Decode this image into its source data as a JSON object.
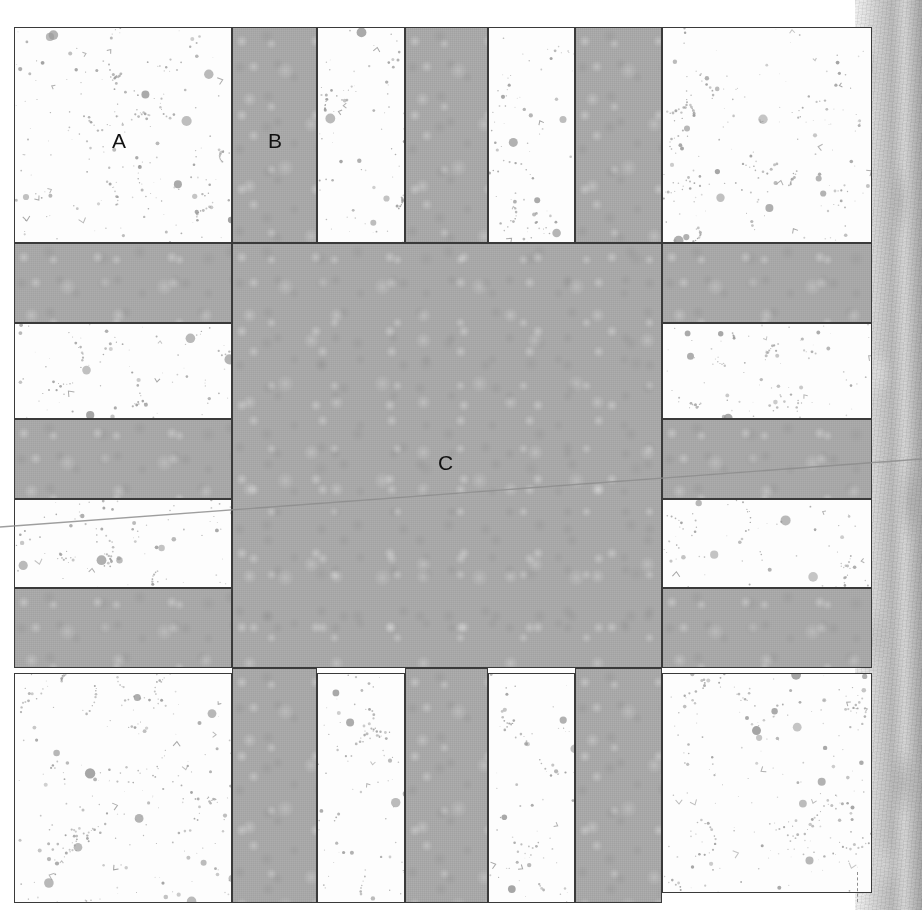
{
  "figure": {
    "kind": "geological-thin-section-schematic",
    "background_color": "#ffffff",
    "canvas": {
      "width": 922,
      "height": 910
    }
  },
  "palette": {
    "matrix_gray": "#aaaaaa",
    "clast_white": "#fdfdfd",
    "outline": "#3a3a3a",
    "speckle": "#9a9a9a",
    "label_text": "#111111",
    "crack_line": "#8d8d8d",
    "edge_light": "#f2f2f2",
    "edge_dark": "#a9a9a9"
  },
  "labels": [
    {
      "id": "label-a",
      "text": "A",
      "x": 112,
      "y": 130,
      "describes": "white speckled clast block (upper-left)"
    },
    {
      "id": "label-b",
      "text": "B",
      "x": 268,
      "y": 130,
      "describes": "gray matrix band (upper, second column)"
    },
    {
      "id": "label-c",
      "text": "C",
      "x": 438,
      "y": 452,
      "describes": "large central gray matrix region"
    }
  ],
  "grid": {
    "outer": {
      "x": 14,
      "y": 27,
      "width": 858,
      "height": 876
    },
    "column_edges": [
      14,
      232,
      317,
      405,
      488,
      575,
      662,
      872
    ],
    "row_edges": [
      27,
      243,
      323,
      419,
      499,
      588,
      668,
      903
    ],
    "description": "Seven vertical column bands and seven horizontal row bands forming an alternating white-clast / gray-matrix checker pattern around a large central gray region."
  },
  "cells": [
    {
      "name": "cell-r1c1",
      "fill": "white",
      "x": 14,
      "y": 27,
      "w": 218,
      "h": 216
    },
    {
      "name": "cell-r1c2",
      "fill": "gray",
      "x": 232,
      "y": 27,
      "w": 85,
      "h": 216
    },
    {
      "name": "cell-r1c3",
      "fill": "white",
      "x": 317,
      "y": 27,
      "w": 88,
      "h": 216
    },
    {
      "name": "cell-r1c4",
      "fill": "gray",
      "x": 405,
      "y": 27,
      "w": 83,
      "h": 216
    },
    {
      "name": "cell-r1c5",
      "fill": "white",
      "x": 488,
      "y": 27,
      "w": 87,
      "h": 216
    },
    {
      "name": "cell-r1c6",
      "fill": "gray",
      "x": 575,
      "y": 27,
      "w": 87,
      "h": 216
    },
    {
      "name": "cell-r1c7",
      "fill": "white",
      "x": 662,
      "y": 27,
      "w": 210,
      "h": 216
    },
    {
      "name": "cell-r2c1",
      "fill": "gray",
      "x": 14,
      "y": 243,
      "w": 218,
      "h": 80
    },
    {
      "name": "cell-r2c7",
      "fill": "gray",
      "x": 662,
      "y": 243,
      "w": 210,
      "h": 80
    },
    {
      "name": "cell-r3c1",
      "fill": "white",
      "x": 14,
      "y": 323,
      "w": 218,
      "h": 96
    },
    {
      "name": "cell-r3c7",
      "fill": "white",
      "x": 662,
      "y": 323,
      "w": 210,
      "h": 96
    },
    {
      "name": "cell-r4c1",
      "fill": "gray",
      "x": 14,
      "y": 419,
      "w": 218,
      "h": 80
    },
    {
      "name": "cell-r4c7",
      "fill": "gray",
      "x": 662,
      "y": 419,
      "w": 210,
      "h": 80
    },
    {
      "name": "cell-r5c1",
      "fill": "white",
      "x": 14,
      "y": 499,
      "w": 218,
      "h": 89
    },
    {
      "name": "cell-r5c7",
      "fill": "white",
      "x": 662,
      "y": 499,
      "w": 210,
      "h": 89
    },
    {
      "name": "cell-r6c1",
      "fill": "gray",
      "x": 14,
      "y": 588,
      "w": 218,
      "h": 80
    },
    {
      "name": "cell-r6c7",
      "fill": "gray",
      "x": 662,
      "y": 588,
      "w": 210,
      "h": 80
    },
    {
      "name": "cell-center-c",
      "fill": "gray",
      "x": 232,
      "y": 243,
      "w": 430,
      "h": 425
    },
    {
      "name": "cell-r7c1",
      "fill": "white",
      "x": 14,
      "y": 673,
      "w": 218,
      "h": 230
    },
    {
      "name": "cell-r7c2",
      "fill": "gray",
      "x": 232,
      "y": 668,
      "w": 85,
      "h": 235
    },
    {
      "name": "cell-r7c3",
      "fill": "white",
      "x": 317,
      "y": 673,
      "w": 88,
      "h": 230
    },
    {
      "name": "cell-r7c4",
      "fill": "gray",
      "x": 405,
      "y": 668,
      "w": 83,
      "h": 235
    },
    {
      "name": "cell-r7c5",
      "fill": "white",
      "x": 488,
      "y": 673,
      "w": 87,
      "h": 230
    },
    {
      "name": "cell-r7c6",
      "fill": "gray",
      "x": 575,
      "y": 668,
      "w": 87,
      "h": 235
    },
    {
      "name": "cell-r7c7",
      "fill": "white",
      "x": 662,
      "y": 673,
      "w": 210,
      "h": 220
    }
  ],
  "crack": {
    "name": "diagonal-hairline-crack",
    "from": {
      "x": 0,
      "y": 527
    },
    "to": {
      "x": 922,
      "y": 459
    },
    "color": "#8d8d8d",
    "width": 1.4
  },
  "right_edge": {
    "name": "textured-rock-edge",
    "x": 855,
    "y": 0,
    "width": 67,
    "height": 910,
    "description": "Vertical mottled light-gray textured strip resembling a torn/weathered rock margin."
  },
  "bottom_dash": {
    "name": "dashed-tick-mark",
    "x": 857,
    "y": 872,
    "length": 30,
    "color": "#8e8e8e"
  }
}
